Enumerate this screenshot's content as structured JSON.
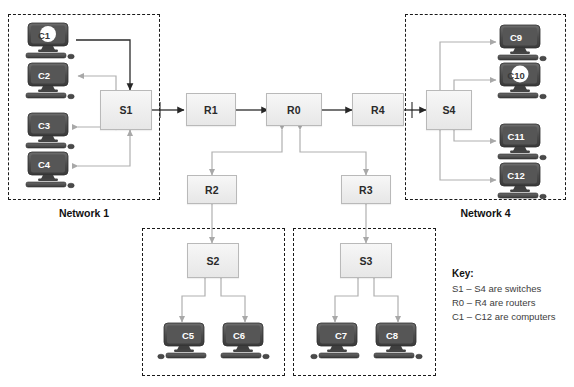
{
  "diagram": {
    "background_color": "#ffffff",
    "wire_color": "#b0b0b0",
    "device_fill": "#efefef",
    "device_border": "#b9b9b9",
    "boundary_color": "#1a1a1a",
    "monitor_color": "#4a4a4a"
  },
  "networks": [
    {
      "id": "network-1",
      "label": "Network 1"
    },
    {
      "id": "network-2",
      "label": ""
    },
    {
      "id": "network-3",
      "label": ""
    },
    {
      "id": "network-4",
      "label": "Network 4"
    }
  ],
  "switches": [
    {
      "id": "s1",
      "label": "S1"
    },
    {
      "id": "s2",
      "label": "S2"
    },
    {
      "id": "s3",
      "label": "S3"
    },
    {
      "id": "s4",
      "label": "S4"
    }
  ],
  "routers": [
    {
      "id": "r1",
      "label": "R1"
    },
    {
      "id": "r0",
      "label": "R0"
    },
    {
      "id": "r4",
      "label": "R4"
    },
    {
      "id": "r2",
      "label": "R2"
    },
    {
      "id": "r3",
      "label": "R3"
    }
  ],
  "computers": [
    {
      "id": "c1",
      "label": "C1",
      "network": "Network 1",
      "highlight": true
    },
    {
      "id": "c2",
      "label": "C2",
      "network": "Network 1",
      "highlight": false
    },
    {
      "id": "c3",
      "label": "C3",
      "network": "Network 1",
      "highlight": false
    },
    {
      "id": "c4",
      "label": "C4",
      "network": "Network 1",
      "highlight": false
    },
    {
      "id": "c5",
      "label": "C5",
      "network": "Network 2",
      "highlight": false
    },
    {
      "id": "c6",
      "label": "C6",
      "network": "Network 2",
      "highlight": false
    },
    {
      "id": "c7",
      "label": "C7",
      "network": "Network 3",
      "highlight": false
    },
    {
      "id": "c8",
      "label": "C8",
      "network": "Network 3",
      "highlight": false
    },
    {
      "id": "c9",
      "label": "C9",
      "network": "Network 4",
      "highlight": false
    },
    {
      "id": "c10",
      "label": "C10",
      "network": "Network 4",
      "highlight": true
    },
    {
      "id": "c11",
      "label": "C11",
      "network": "Network 4",
      "highlight": false
    },
    {
      "id": "c12",
      "label": "C12",
      "network": "Network 4",
      "highlight": false
    }
  ],
  "key": {
    "title": "Key:",
    "lines": [
      "S1 – S4 are switches",
      "R0 – R4 are routers",
      "C1 – C12 are computers"
    ]
  },
  "links": [
    {
      "from": "C1",
      "to": "S1",
      "direction": "one-way"
    },
    {
      "from": "S1",
      "to": "C2",
      "direction": "one-way"
    },
    {
      "from": "C3",
      "to": "S1",
      "direction": "one-way"
    },
    {
      "from": "C4",
      "to": "S1",
      "direction": "one-way"
    },
    {
      "from": "S1",
      "to": "R1",
      "direction": "one-way"
    },
    {
      "from": "R1",
      "to": "R0",
      "direction": "one-way"
    },
    {
      "from": "R0",
      "to": "R4",
      "direction": "one-way"
    },
    {
      "from": "R4",
      "to": "S4",
      "direction": "one-way"
    },
    {
      "from": "R0",
      "to": "R2",
      "direction": "two-way"
    },
    {
      "from": "R0",
      "to": "R3",
      "direction": "two-way"
    },
    {
      "from": "R2",
      "to": "S2",
      "direction": "two-way"
    },
    {
      "from": "R3",
      "to": "S3",
      "direction": "two-way"
    },
    {
      "from": "S2",
      "to": "C5",
      "direction": "two-way"
    },
    {
      "from": "S2",
      "to": "C6",
      "direction": "two-way"
    },
    {
      "from": "S3",
      "to": "C7",
      "direction": "two-way"
    },
    {
      "from": "S3",
      "to": "C8",
      "direction": "two-way"
    },
    {
      "from": "S4",
      "to": "C9",
      "direction": "one-way"
    },
    {
      "from": "S4",
      "to": "C10",
      "direction": "one-way"
    },
    {
      "from": "S4",
      "to": "C11",
      "direction": "one-way"
    },
    {
      "from": "S4",
      "to": "C12",
      "direction": "one-way"
    }
  ]
}
